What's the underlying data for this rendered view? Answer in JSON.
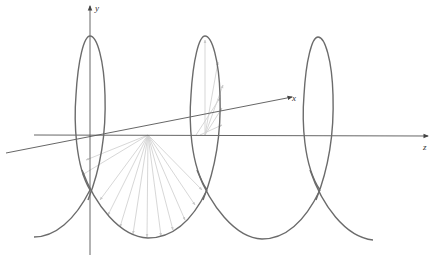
{
  "figure": {
    "type": "3D helix with position vectors",
    "axes": {
      "x_label": "x",
      "y_label": "y",
      "z_label": "z"
    },
    "helix": {
      "turns_visible": 3,
      "loop_centers_px": [
        90,
        205,
        318
      ],
      "stroke_color": "#6b6b6b"
    },
    "vectors": {
      "description": "Position vectors from z-axis to points on helix",
      "stroke_color": "#cfcfcf"
    },
    "colors": {
      "axis": "#555555",
      "helix": "#6b6b6b",
      "vectors": "#cfcfcf",
      "background": "#ffffff"
    }
  }
}
